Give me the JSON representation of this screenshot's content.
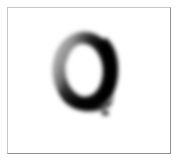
{
  "image": {
    "kind": "handwritten-digit-sample",
    "background_color": "#ffffff",
    "ink_color": "#000000",
    "frame": {
      "border_light_color": "#c9c9c9",
      "border_dark_color": "#8f8f8f",
      "inset_px": 7,
      "width_px": 164,
      "height_px": 147
    },
    "glyph": {
      "character": "0",
      "label": "zero",
      "style": "blurry grayscale handwritten stroke",
      "bounding_box": {
        "x": 58,
        "y": 33,
        "width": 64,
        "height": 80
      },
      "stroke_weight_note": "thick and near-black on the right and bottom, thin and light gray on the upper-left",
      "open_gap": "top-left",
      "counter_note": "white open interior counter, slightly off-center to the left"
    },
    "artifact": {
      "name": "ink-speck",
      "description": "small dark speck below and right of the glyph",
      "x": 102,
      "y": 112,
      "width": 7,
      "height": 5
    }
  },
  "canvas": {
    "width": 179,
    "height": 163
  }
}
